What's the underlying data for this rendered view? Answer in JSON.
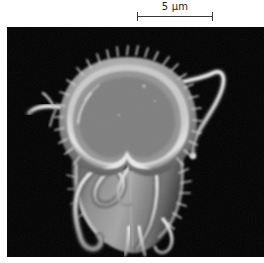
{
  "figure": {
    "kind": "scanning-electron-micrograph",
    "background_color": "#ffffff",
    "panel_color": "#020202"
  },
  "scalebar": {
    "label": "5 µm",
    "value": 5,
    "unit": "µm",
    "color": "#3a3a3a",
    "length_px": 76,
    "position": "top-right"
  },
  "micrograph": {
    "subject": "Giardia trophozoite",
    "panel": {
      "x": 7,
      "y": 27,
      "width": 257,
      "height": 230
    },
    "specimen_colors": {
      "highlight": "#f2f2f2",
      "midtone": "#a9a9a9",
      "shadow": "#5a5a5a",
      "deep": "#2b2b2b",
      "background": "#020202"
    },
    "features": [
      "ventral-adhesive-disc",
      "disc-notch",
      "spiky-marginal-microvilli",
      "anterolateral-flagellum-right",
      "anterolateral-flagellum-left",
      "ventral-flagella",
      "caudal-flagella",
      "posterior-tail"
    ]
  }
}
